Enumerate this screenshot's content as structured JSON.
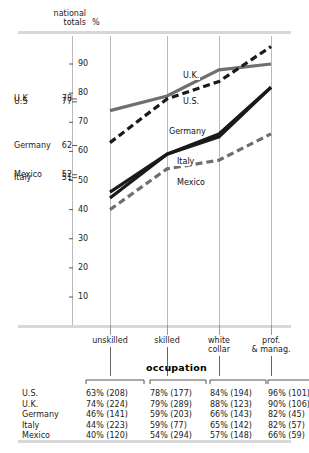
{
  "header": {
    "national": "national",
    "totals": "totals",
    "percent": "%"
  },
  "national_totals": [
    {
      "name": "U.K",
      "value": "78",
      "y": 78
    },
    {
      "name": "U.S",
      "value": "77",
      "y": 77
    },
    {
      "name": "Germany",
      "value": "62",
      "y": 62
    },
    {
      "name": "Mexico",
      "value": "52",
      "y": 52
    },
    {
      "name": "Italy",
      "value": "51",
      "y": 51
    }
  ],
  "axis": {
    "ticks": [
      "90",
      "80",
      "70",
      "60",
      "50",
      "40",
      "30",
      "20",
      "10"
    ],
    "tick_values": [
      90,
      80,
      70,
      60,
      50,
      40,
      30,
      20,
      10
    ]
  },
  "categories": [
    {
      "label_line1": "unskilled",
      "label_line2": ""
    },
    {
      "label_line1": "skilled",
      "label_line2": ""
    },
    {
      "label_line1": "white",
      "label_line2": "collar"
    },
    {
      "label_line1": "prof.",
      "label_line2": "& manag."
    }
  ],
  "axis_group_label": "occupation",
  "series_labels": [
    {
      "name": "U.K."
    },
    {
      "name": "U.S."
    },
    {
      "name": "Germany"
    },
    {
      "name": "Italy"
    },
    {
      "name": "Mexico"
    }
  ],
  "table": {
    "row_header": "",
    "rows": [
      {
        "country": "U.S.",
        "cells": [
          "63% (208)",
          "78% (177)",
          "84% (194)",
          "96% (101)"
        ]
      },
      {
        "country": "U.K.",
        "cells": [
          "74% (224)",
          "79% (289)",
          "88% (123)",
          "90% (106)"
        ]
      },
      {
        "country": "Germany",
        "cells": [
          "46% (141)",
          "59% (203)",
          "66% (143)",
          "82% (45)"
        ]
      },
      {
        "country": "Italy",
        "cells": [
          "44% (223)",
          "59% (77)",
          "65% (142)",
          "82% (57)"
        ]
      },
      {
        "country": "Mexico",
        "cells": [
          "40% (120)",
          "54% (294)",
          "57% (148)",
          "66% (59)"
        ]
      }
    ]
  },
  "colors": {
    "dark": "#1a1a1a",
    "gray": "#6f6f6f",
    "rule": "#d8d8d8",
    "gridline": "#b9b9b9"
  },
  "chart_data": {
    "type": "line",
    "title": "",
    "xlabel": "occupation",
    "ylabel": "%",
    "categories": [
      "unskilled",
      "skilled",
      "white collar",
      "prof. & manag."
    ],
    "ylim": [
      0,
      95
    ],
    "grid": true,
    "legend": "inline-labels",
    "series": [
      {
        "name": "U.K.",
        "values": [
          74,
          79,
          88,
          90
        ],
        "counts": [
          224,
          289,
          123,
          106
        ],
        "national_total": 78,
        "style": "solid",
        "color": "#6f6f6f"
      },
      {
        "name": "U.S.",
        "values": [
          63,
          78,
          84,
          96
        ],
        "counts": [
          208,
          177,
          194,
          101
        ],
        "national_total": 77,
        "style": "dashed",
        "color": "#1a1a1a"
      },
      {
        "name": "Germany",
        "values": [
          46,
          59,
          66,
          82
        ],
        "counts": [
          141,
          203,
          143,
          45
        ],
        "national_total": 62,
        "style": "solid",
        "color": "#1a1a1a"
      },
      {
        "name": "Italy",
        "values": [
          44,
          59,
          65,
          82
        ],
        "counts": [
          223,
          77,
          142,
          57
        ],
        "national_total": 51,
        "style": "solid",
        "color": "#1a1a1a"
      },
      {
        "name": "Mexico",
        "values": [
          40,
          54,
          57,
          66
        ],
        "counts": [
          120,
          294,
          148,
          59
        ],
        "national_total": 52,
        "style": "dashed",
        "color": "#6f6f6f"
      }
    ]
  }
}
